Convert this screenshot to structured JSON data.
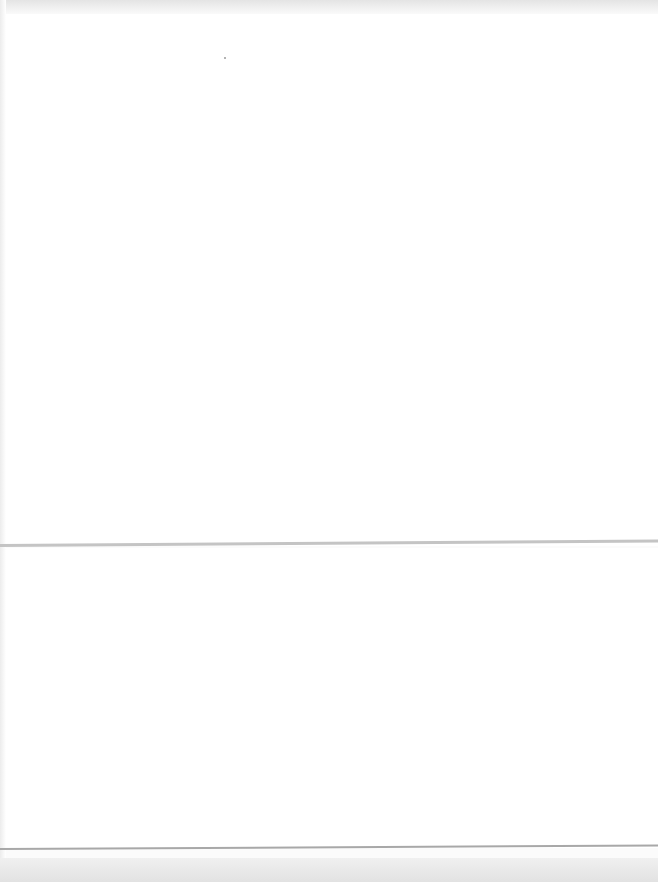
{
  "page": {
    "colors": {
      "paper": "#ffffff",
      "edge_shadow": "#c4c4c4",
      "background": "#e2e2e2"
    }
  }
}
